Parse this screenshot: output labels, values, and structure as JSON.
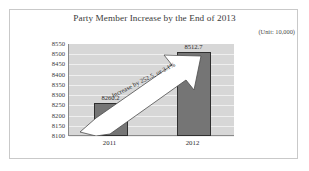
{
  "chart_data": {
    "type": "bar",
    "title": "Party Member Increase by the End of 2013",
    "unit_note": "(Unit: 10,000)",
    "categories": [
      "2011",
      "2012"
    ],
    "values": [
      8260.2,
      8512.7
    ],
    "data_labels": [
      "8260.2",
      "8512.7"
    ],
    "xlabel": "",
    "ylabel": "",
    "ylim": [
      8100,
      8550
    ],
    "ytick_step": 50,
    "yticks": [
      "8550",
      "8500",
      "8450",
      "8400",
      "8350",
      "8300",
      "8250",
      "8200",
      "8150",
      "8100"
    ],
    "grid": true,
    "legend": false,
    "annotations": [
      {
        "name": "increase-callout",
        "text": "Increase by 252.5, or 3.1%",
        "shape": "up-right-arrow"
      }
    ],
    "colors": {
      "bar_fill": "#757575",
      "bar_outline": "#2f2f2f",
      "plot_background": "#d7d7d7",
      "gridline": "#efefef",
      "axis": "#8a8a8a",
      "arrow_fill": "#ffffff",
      "arrow_outline": "#4c4c4c",
      "page_background": "#ffffff",
      "frame_border": "#c9c9c9",
      "title_text": "#3a3a3a"
    }
  }
}
